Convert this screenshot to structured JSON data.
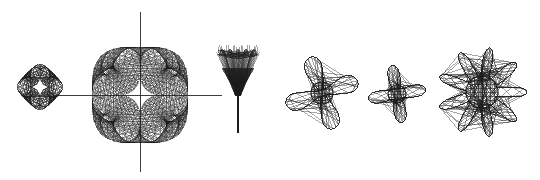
{
  "plate": {
    "title": "Harmonograph / spirograph figure plate",
    "caption": "",
    "background_color": "#ffffff",
    "ink_color": "#1c1c1c",
    "width": 540,
    "height": 180
  },
  "chart_data": {
    "type": "line",
    "xlabel": "",
    "ylabel": "",
    "grid": false,
    "legend": "none",
    "xlim": [
      0,
      540
    ],
    "ylim": [
      0,
      180
    ],
    "figures": [
      {
        "index": 1,
        "name": "small-diamond-rosette",
        "label": "Figure 1",
        "form": "diamond-spirograph",
        "center": [
          40,
          87
        ],
        "radius": 19,
        "lobes": 4,
        "line_count": 120,
        "rotation_deg": 45,
        "has_axes": false,
        "white_core": "4-point astroid",
        "core_radius": 7
      },
      {
        "index": 2,
        "name": "large-rounded-square-spirograph",
        "label": "Figure 2",
        "form": "rounded-square-envelope",
        "center": [
          140,
          95
        ],
        "radius": 48,
        "lobes": 4,
        "line_count": 240,
        "rotation_deg": 0,
        "has_axes": true,
        "axis_x_range": [
          57,
          222
        ],
        "axis_y_range": [
          12,
          172
        ],
        "white_core": "4-point astroid",
        "core_radius": 15
      },
      {
        "index": 3,
        "name": "tulip-goblet-figure",
        "label": "Figure 3",
        "form": "funnel-with-stem",
        "center": [
          238,
          72
        ],
        "width": 40,
        "height": 48,
        "line_count": 90,
        "stem_top": 96,
        "stem_bottom": 133,
        "has_axes": false
      },
      {
        "index": 4,
        "name": "four-arm-curly-starfish",
        "label": "Figure 4",
        "form": "curled-tentacle-star",
        "center": [
          322,
          93
        ],
        "radius": 33,
        "arms": 4,
        "line_count": 110,
        "rotation_deg": 20,
        "body_radius": 11,
        "has_axes": false
      },
      {
        "index": 5,
        "name": "four-arm-pointed-star",
        "label": "Figure 5",
        "form": "tapered-cross-star",
        "center": [
          397,
          94
        ],
        "radius": 28,
        "arms": 4,
        "line_count": 100,
        "rotation_deg": 10,
        "body_radius": 9,
        "has_axes": false
      },
      {
        "index": 6,
        "name": "nine-arm-sunburst-star",
        "label": "Figure 6",
        "form": "radial-sunburst",
        "center": [
          482,
          92
        ],
        "radius": 44,
        "arms": 9,
        "line_count": 200,
        "rotation_deg": 0,
        "body_radius": 16,
        "has_axes": false
      }
    ]
  }
}
